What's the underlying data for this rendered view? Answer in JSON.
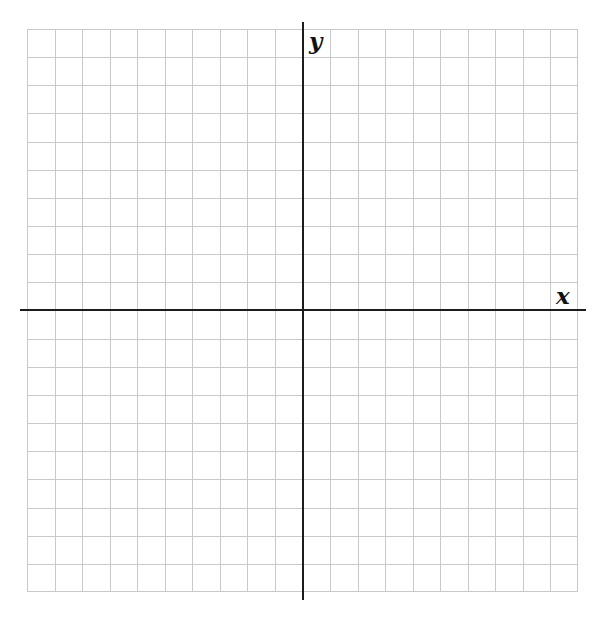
{
  "chart_data": {
    "type": "grid",
    "title": "",
    "subtitle": "",
    "xlabel": "x",
    "ylabel": "y",
    "xlim": [
      -11,
      9
    ],
    "ylim": [
      -10,
      10
    ],
    "grid": true,
    "grid_major_step": 1,
    "grid_color": "#c9c9c9",
    "axis_color": "#1c1c1c",
    "background_color": "#ffffff",
    "tick_labels_x": [],
    "tick_labels_y": [],
    "legend": [],
    "annotations": [],
    "series": [],
    "columns_count": 20,
    "rows_count": 20
  },
  "canvas": {
    "width": 603,
    "height": 625,
    "background": "#ffffff"
  },
  "axes": {
    "x_label": "x",
    "y_label": "y"
  }
}
